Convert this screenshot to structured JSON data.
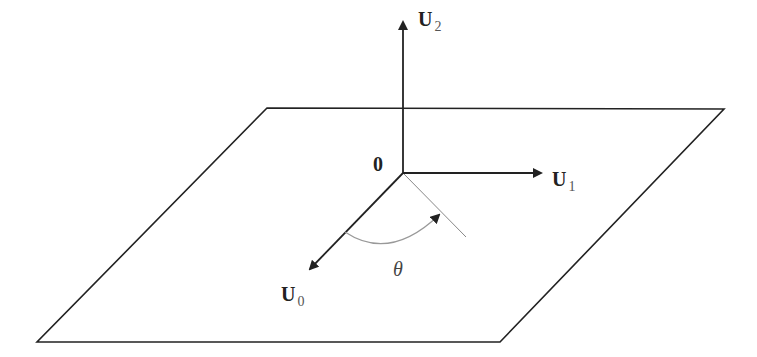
{
  "diagram": {
    "plane": {
      "corners": [
        [
          267,
          108
        ],
        [
          724,
          109
        ],
        [
          500,
          342
        ],
        [
          37,
          342
        ]
      ],
      "stroke": "#222222"
    },
    "origin": {
      "label": "0",
      "point": [
        403,
        173
      ]
    },
    "vectors": [
      {
        "name": "U",
        "subscript": "2",
        "from": [
          403,
          173
        ],
        "to": [
          403,
          22
        ]
      },
      {
        "name": "U",
        "subscript": "1",
        "from": [
          403,
          173
        ],
        "to": [
          541,
          173
        ]
      },
      {
        "name": "U",
        "subscript": "0",
        "from": [
          403,
          173
        ],
        "to": [
          310,
          269
        ]
      }
    ],
    "reference_line": {
      "from": [
        403,
        173
      ],
      "to": [
        466,
        237
      ],
      "stroke": "#888888"
    },
    "angle": {
      "label": "θ",
      "arc_color": "#999999"
    }
  },
  "labels": {
    "u2": {
      "main": "U",
      "sub": "2"
    },
    "u1": {
      "main": "U",
      "sub": "1"
    },
    "u0": {
      "main": "U",
      "sub": "0"
    },
    "origin": "0",
    "theta": "θ"
  }
}
